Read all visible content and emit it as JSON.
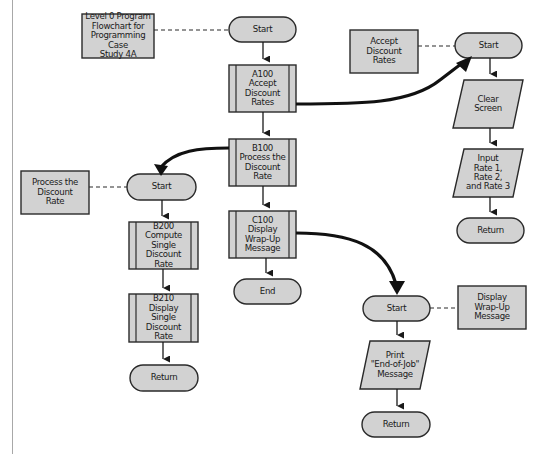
{
  "diagram": {
    "type": "program-flowchart",
    "colors": {
      "fill": "#d2d2d2",
      "stroke": "#2a2a2a",
      "text": "#1a1a1a",
      "background": "#ffffff"
    },
    "notes": {
      "title": "Level 0 Program\nFlowchart for\nProgramming Case\nStudy 4A",
      "accept": "Accept\nDiscount\nRates",
      "process": "Process the\nDiscount\nRate",
      "wrapup": "Display\nWrap-Up\nMessage"
    },
    "main_flow": {
      "start": "Start",
      "a100": "A100\nAccept\nDiscount\nRates",
      "b100": "B100\nProcess the\nDiscount\nRate",
      "c100": "C100\nDisplay\nWrap-Up\nMessage",
      "end": "End"
    },
    "accept_flow": {
      "start": "Start",
      "clear": "Clear\nScreen",
      "input": "Input\nRate 1,\nRate 2,\nand Rate 3",
      "return": "Return"
    },
    "process_flow": {
      "start": "Start",
      "b200": "B200\nCompute\nSingle\nDiscount Rate",
      "b210": "B210\nDisplay\nSingle\nDiscount\nRate",
      "return": "Return"
    },
    "wrapup_flow": {
      "start": "Start",
      "print": "Print\n\"End-of-Job\"\nMessage",
      "return": "Return"
    }
  }
}
